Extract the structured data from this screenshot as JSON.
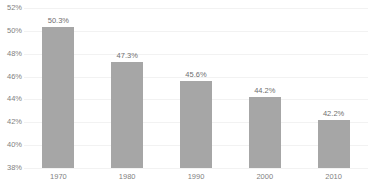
{
  "chart_data": {
    "type": "bar",
    "title": "",
    "xlabel": "",
    "ylabel": "",
    "categories": [
      "1970",
      "1980",
      "1990",
      "2000",
      "2010"
    ],
    "values": [
      50.3,
      47.3,
      45.6,
      44.2,
      42.2
    ],
    "data_labels": [
      "50.3%",
      "47.3%",
      "45.6%",
      "44.2%",
      "42.2%"
    ],
    "ytick_labels": [
      "52%",
      "50%",
      "48%",
      "46%",
      "44%",
      "42%",
      "40%",
      "38%"
    ],
    "ytick_values": [
      52,
      50,
      48,
      46,
      44,
      42,
      40,
      38
    ],
    "ylim": [
      38,
      52
    ],
    "grid": true,
    "legend": false,
    "bar_color": "#a6a6a6",
    "gridline_color": "#f2f2f2",
    "axis_line_color": "#d9d9d9",
    "label_color": "#7f7f7f",
    "background_color": "#ffffff"
  }
}
